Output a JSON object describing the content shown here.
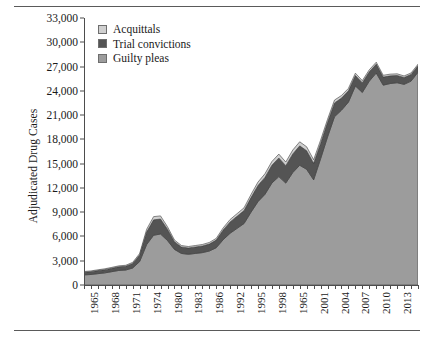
{
  "chart_data": {
    "type": "area",
    "stacked": true,
    "title": "",
    "xlabel": "",
    "ylabel": "Adjudicated Drug Cases",
    "ylim": [
      0,
      33000
    ],
    "ytick_labels": [
      "0",
      "3,000",
      "6,000",
      "9,000",
      "12,000",
      "15,000",
      "18,000",
      "21,000",
      "24,000",
      "27,000",
      "30,000",
      "33,000"
    ],
    "ytick_values": [
      0,
      3000,
      6000,
      9000,
      12000,
      15000,
      18000,
      21000,
      24000,
      27000,
      30000,
      33000
    ],
    "grid": false,
    "legend_position": "top-left",
    "x": [
      1965,
      1966,
      1967,
      1968,
      1969,
      1970,
      1971,
      1972,
      1973,
      1974,
      1975,
      1976,
      1977,
      1978,
      1979,
      1980,
      1981,
      1982,
      1983,
      1984,
      1985,
      1986,
      1987,
      1988,
      1989,
      1990,
      1991,
      1992,
      1993,
      1994,
      1995,
      1996,
      1997,
      1998,
      1999,
      2000,
      2001,
      2002,
      2003,
      2004,
      2005,
      2006,
      2007,
      2008,
      2009,
      2010,
      2011,
      2012,
      2013
    ],
    "xtick_labels": [
      "1965",
      "1968",
      "1971",
      "1974",
      "1980",
      "1983",
      "1986",
      "1992",
      "1995",
      "1998",
      "1965",
      "2001",
      "2004",
      "2007",
      "2010",
      "2013"
    ],
    "xtick_label_positions": [
      1965,
      1968,
      1971,
      1974,
      1977,
      1980,
      1983,
      1986,
      1989,
      1992,
      1995,
      1998,
      2001,
      2004,
      2007,
      2010
    ],
    "series": [
      {
        "name": "Guilty pleas",
        "color": "#9c9c9c",
        "values": [
          1250,
          1300,
          1400,
          1500,
          1650,
          1800,
          1850,
          2100,
          2900,
          5000,
          6150,
          6300,
          5500,
          4400,
          3900,
          3800,
          3900,
          4000,
          4200,
          4600,
          5600,
          6400,
          7000,
          7600,
          9000,
          10300,
          11200,
          12600,
          13400,
          12600,
          13900,
          14800,
          14300,
          13000,
          15600,
          18300,
          20800,
          21600,
          22600,
          24600,
          23800,
          25200,
          26200,
          24700,
          24900,
          25000,
          24800,
          25200,
          26300
        ]
      },
      {
        "name": "Trial convictions",
        "color": "#545454",
        "values": [
          330,
          350,
          380,
          400,
          420,
          450,
          470,
          560,
          800,
          1550,
          1900,
          1850,
          1400,
          950,
          800,
          780,
          800,
          820,
          860,
          950,
          1200,
          1400,
          1500,
          1600,
          1800,
          2000,
          2100,
          2200,
          2300,
          2150,
          2300,
          2400,
          2300,
          2050,
          1900,
          1800,
          1700,
          1500,
          1400,
          1300,
          1200,
          1150,
          1100,
          1000,
          950,
          900,
          850,
          820,
          800
        ]
      },
      {
        "name": "Acquittals",
        "color": "#d0d0d0",
        "values": [
          90,
          95,
          100,
          105,
          110,
          115,
          120,
          140,
          190,
          330,
          400,
          390,
          300,
          210,
          180,
          175,
          180,
          185,
          195,
          210,
          260,
          300,
          320,
          340,
          380,
          420,
          440,
          460,
          480,
          450,
          480,
          500,
          480,
          430,
          400,
          380,
          360,
          320,
          300,
          280,
          260,
          250,
          240,
          220,
          210,
          200,
          190,
          185,
          180
        ]
      }
    ]
  },
  "legend": {
    "items": [
      {
        "label": "Acquittals",
        "color": "#d0d0d0"
      },
      {
        "label": "Trial convictions",
        "color": "#545454"
      },
      {
        "label": "Guilty pleas",
        "color": "#9c9c9c"
      }
    ]
  },
  "axes": {
    "y_title": "Adjudicated Drug Cases"
  }
}
